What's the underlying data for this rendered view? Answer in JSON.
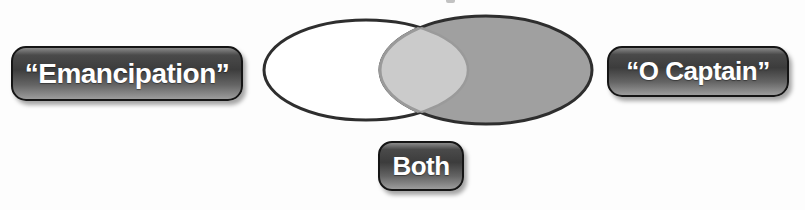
{
  "venn": {
    "type": "venn",
    "sets": [
      {
        "label": "“Emancipation”",
        "fill": "#ffffff"
      },
      {
        "label": "“O Captain”",
        "fill": "#a0a0a0"
      }
    ],
    "intersection": {
      "label": "Both",
      "fill": "#cbcbcb"
    }
  },
  "colors": {
    "background": "#fdfdfd",
    "ellipse_outline": "#2e2e2e",
    "left_fill": "#ffffff",
    "right_fill": "#a0a0a0",
    "overlap_fill": "#cbcbcb",
    "overlap_outline": "#9a9a9a",
    "label_text": "#ffffff",
    "label_border": "#151515",
    "label_dark": "#3c3c3c",
    "label_light": "#9c9c9c"
  }
}
